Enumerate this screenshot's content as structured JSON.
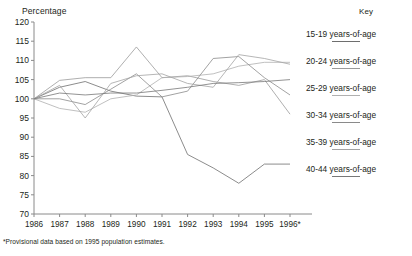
{
  "chart_data": {
    "type": "line",
    "title": "",
    "ylabel": "Percentage",
    "xlabel": "",
    "ylim": [
      70,
      120
    ],
    "yticks": [
      70,
      75,
      80,
      85,
      90,
      95,
      100,
      105,
      110,
      115,
      120
    ],
    "grid": false,
    "legend_position": "right",
    "legend_title": "Key",
    "x": [
      "1986",
      "1987",
      "1988",
      "1989",
      "1990",
      "1991",
      "1992",
      "1993",
      "1994",
      "1995",
      "1996*"
    ],
    "categories": [
      "1986",
      "1987",
      "1988",
      "1989",
      "1990",
      "1991",
      "1992",
      "1993",
      "1994",
      "1995",
      "1996*"
    ],
    "series": [
      {
        "name": "15-19 years-of-age",
        "color": "#6e6e6e",
        "values": [
          100.0,
          103.0,
          104.5,
          102.0,
          100.7,
          100.5,
          85.5,
          82.0,
          78.0,
          83.0,
          83.0
        ]
      },
      {
        "name": "20-24 years-of-age",
        "color": "#9a9a9a",
        "values": [
          100.0,
          104.8,
          105.5,
          105.5,
          113.5,
          105.5,
          106.0,
          104.5,
          103.5,
          105.0,
          96.0
        ]
      },
      {
        "name": "25-29 years-of-age",
        "color": "#b0b0b0",
        "values": [
          100.0,
          97.5,
          96.5,
          100.0,
          101.0,
          105.5,
          105.8,
          106.5,
          108.5,
          109.5,
          109.5
        ]
      },
      {
        "name": "30-34 years-of-age",
        "color": "#8a8a8a",
        "values": [
          100.0,
          100.0,
          98.5,
          102.5,
          106.5,
          100.5,
          102.0,
          110.5,
          111.0,
          105.5,
          101.0
        ]
      },
      {
        "name": "35-39 years-of-age",
        "color": "#a3a3a3",
        "values": [
          100.0,
          103.5,
          95.0,
          104.0,
          106.0,
          106.5,
          104.0,
          103.0,
          111.5,
          110.5,
          109.0
        ]
      },
      {
        "name": "40-44 years-of-age",
        "color": "#777777",
        "values": [
          100.0,
          101.5,
          101.0,
          101.5,
          101.5,
          102.2,
          103.0,
          104.0,
          104.2,
          104.5,
          105.0
        ]
      }
    ],
    "footnote": "*Provisional data based on 1995 population estimates."
  },
  "legend": {
    "title": "Key",
    "items": [
      {
        "label": "15-19 years-of-age"
      },
      {
        "label": "20-24 years-of-age"
      },
      {
        "label": "25-29 years-of-age"
      },
      {
        "label": "30-34 years-of-age"
      },
      {
        "label": "35-39 years-of-age"
      },
      {
        "label": "40-44 years-of-age"
      }
    ]
  },
  "footnote": {
    "text": "*Provisional data based on 1995 population estimates."
  }
}
